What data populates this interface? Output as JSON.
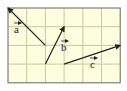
{
  "figure": {
    "background": "#fdfde0",
    "grid_color": "#c9c99a",
    "border_color": "#666666",
    "vector_color": "#222222",
    "grid": {
      "cols": 6,
      "rows": 4,
      "x0": 8,
      "y0": 8,
      "cell": 18.7
    },
    "vectors": [
      {
        "name": "a",
        "label": "a",
        "from": [
          2,
          2
        ],
        "to": [
          0,
          0
        ],
        "label_pos": [
          14,
          33
        ]
      },
      {
        "name": "b",
        "label": "b",
        "from": [
          2,
          3
        ],
        "to": [
          3,
          1
        ],
        "label_pos": [
          61,
          51
        ]
      },
      {
        "name": "c",
        "label": "c",
        "from": [
          3,
          3
        ],
        "to": [
          6,
          2
        ],
        "label_pos": [
          90,
          68
        ]
      }
    ]
  }
}
